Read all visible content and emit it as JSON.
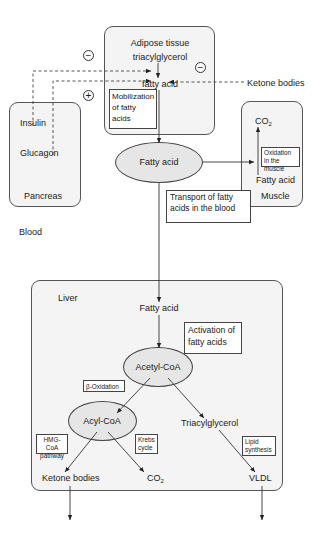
{
  "diagram": {
    "regions": {
      "adipose": {
        "title_line1": "Adipose tissue",
        "title_line2": "triacylglycerol",
        "product": "fatty acid",
        "note": "Mobilization of fatty acids"
      },
      "pancreas": {
        "name": "Pancreas",
        "hormone1": "Insulin",
        "hormone2": "Glucagon"
      },
      "muscle": {
        "name": "Muscle",
        "substrate": "Fatty acid",
        "product_main": "CO",
        "product_sub": "2",
        "note": "Oxidation in the muscle"
      },
      "blood": {
        "name": "Blood",
        "node": "Fatty acid",
        "note": "Transport of fatty acids in the blood"
      },
      "liver": {
        "name": "Liver",
        "input": "Fatty acid",
        "activation_note": "Activation of fatty acids",
        "acetyl_coa": "Acetyl-CoA",
        "beta_oxidation_note": "β-Oxidation",
        "acyl_coa": "Acyl-CoA",
        "triacylglycerol": "Triacylglycerol",
        "hmg_note": "HMG-CoA pathway",
        "krebs_note": "Krebs cycle",
        "lipid_note": "Lipid synthesis",
        "ketone_output": "Ketone bodies",
        "co2_main": "CO",
        "co2_sub": "2",
        "vldl_output": "VLDL"
      }
    },
    "regulators": {
      "ketone_bodies": "Ketone bodies",
      "insulin_sign": "−",
      "glucagon_sign": "+",
      "ketone_sign": "−"
    },
    "colors": {
      "region_fill": "#f4f4f4",
      "node_fill": "#e6e6e6",
      "line": "#333333"
    }
  }
}
